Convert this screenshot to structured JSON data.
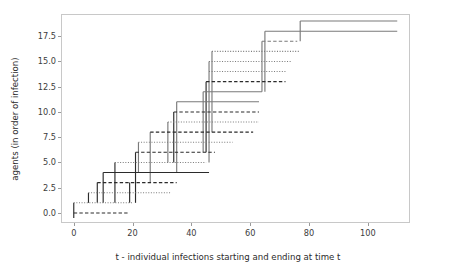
{
  "chart_data": {
    "type": "line",
    "title": "",
    "xlabel": "t - individual infections starting and ending at time t",
    "ylabel": "agents (in order of infection)",
    "xlim": [
      -4,
      114
    ],
    "ylim": [
      -0.9,
      19.6
    ],
    "xticks": [
      0,
      20,
      40,
      60,
      80,
      100
    ],
    "xtick_labels": [
      "0",
      "20",
      "40",
      "60",
      "80",
      "100"
    ],
    "yticks": [
      0.0,
      2.5,
      5.0,
      7.5,
      10.0,
      12.5,
      15.0,
      17.5
    ],
    "ytick_labels": [
      "0.0",
      "2.5",
      "5.0",
      "7.5",
      "10.0",
      "12.5",
      "15.0",
      "17.5"
    ],
    "grid": false,
    "legend": "none",
    "series_description": "Each agent has a horizontal infection-duration segment from start t to end t; vertical lines connect an infector's timeline down/up to the newly infected agent.",
    "segments": [
      {
        "agent": 0,
        "start": 0,
        "end": 19,
        "style": "dashed",
        "color": "#2b2b2b"
      },
      {
        "agent": 1,
        "start": 0,
        "end": 20,
        "style": "dotted",
        "color": "#7a7a7a"
      },
      {
        "agent": 2,
        "start": 5,
        "end": 33,
        "style": "dotted",
        "color": "#7a7a7a"
      },
      {
        "agent": 3,
        "start": 8,
        "end": 35,
        "style": "dashed",
        "color": "#2b2b2b"
      },
      {
        "agent": 4,
        "start": 10,
        "end": 46,
        "style": "solid",
        "color": "#2b2b2b"
      },
      {
        "agent": 5,
        "start": 14,
        "end": 45,
        "style": "dotted",
        "color": "#7a7a7a"
      },
      {
        "agent": 6,
        "start": 21,
        "end": 48,
        "style": "dashed",
        "color": "#2b2b2b"
      },
      {
        "agent": 7,
        "start": 22,
        "end": 54,
        "style": "dotted",
        "color": "#7a7a7a"
      },
      {
        "agent": 8,
        "start": 26,
        "end": 61,
        "style": "dashed",
        "color": "#2b2b2b"
      },
      {
        "agent": 9,
        "start": 32,
        "end": 63,
        "style": "dotted",
        "color": "#7a7a7a"
      },
      {
        "agent": 10,
        "start": 34,
        "end": 63,
        "style": "dashed",
        "color": "#2b2b2b"
      },
      {
        "agent": 11,
        "start": 35,
        "end": 63,
        "style": "solid",
        "color": "#7a7a7a"
      },
      {
        "agent": 12,
        "start": 44,
        "end": 64,
        "style": "solid",
        "color": "#7a7a7a"
      },
      {
        "agent": 13,
        "start": 45,
        "end": 72,
        "style": "dashed",
        "color": "#2b2b2b"
      },
      {
        "agent": 14,
        "start": 46,
        "end": 72,
        "style": "dotted",
        "color": "#7a7a7a"
      },
      {
        "agent": 15,
        "start": 46,
        "end": 74,
        "style": "dotted",
        "color": "#7a7a7a"
      },
      {
        "agent": 16,
        "start": 47,
        "end": 77,
        "style": "dotted",
        "color": "#7a7a7a"
      },
      {
        "agent": 17,
        "start": 64,
        "end": 76,
        "style": "dashed",
        "color": "#7a7a7a"
      },
      {
        "agent": 18,
        "start": 65,
        "end": 110,
        "style": "solid",
        "color": "#7a7a7a"
      },
      {
        "agent": 19,
        "start": 77,
        "end": 110,
        "style": "solid",
        "color": "#7a7a7a"
      }
    ],
    "transmissions": [
      {
        "t": 0,
        "from": 0,
        "to": -0.5,
        "color": "#2b2b2b"
      },
      {
        "t": 0,
        "from": 1,
        "to": 0,
        "color": "#2b2b2b"
      },
      {
        "t": 5,
        "from": 2,
        "to": 1,
        "color": "#2b2b2b"
      },
      {
        "t": 8,
        "from": 3,
        "to": 1,
        "color": "#2b2b2b"
      },
      {
        "t": 10,
        "from": 4,
        "to": 1,
        "color": "#2b2b2b"
      },
      {
        "t": 14,
        "from": 5,
        "to": 1,
        "color": "#2b2b2b"
      },
      {
        "t": 19,
        "from": 3,
        "to": 1,
        "color": "#2b2b2b"
      },
      {
        "t": 21,
        "from": 6,
        "to": 1,
        "color": "#2b2b2b"
      },
      {
        "t": 22,
        "from": 7,
        "to": 4,
        "color": "#7a7a7a"
      },
      {
        "t": 26,
        "from": 8,
        "to": 3,
        "color": "#7a7a7a"
      },
      {
        "t": 32,
        "from": 9,
        "to": 5,
        "color": "#7a7a7a"
      },
      {
        "t": 34,
        "from": 10,
        "to": 5,
        "color": "#2b2b2b"
      },
      {
        "t": 35,
        "from": 11,
        "to": 4,
        "color": "#7a7a7a"
      },
      {
        "t": 44,
        "from": 12,
        "to": 6,
        "color": "#7a7a7a"
      },
      {
        "t": 45,
        "from": 13,
        "to": 6,
        "color": "#2b2b2b"
      },
      {
        "t": 46,
        "from": 15,
        "to": 5,
        "color": "#7a7a7a"
      },
      {
        "t": 47,
        "from": 16,
        "to": 8,
        "color": "#7a7a7a"
      },
      {
        "t": 64,
        "from": 17,
        "to": 12,
        "color": "#7a7a7a"
      },
      {
        "t": 65,
        "from": 18,
        "to": 12,
        "color": "#7a7a7a"
      },
      {
        "t": 77,
        "from": 19,
        "to": 17,
        "color": "#7a7a7a"
      }
    ]
  },
  "colors": {
    "frame": "#c8c8c8",
    "dark": "#2b2b2b",
    "light": "#7a7a7a",
    "background": "#ffffff",
    "tick_text": "#3c3c3c"
  }
}
